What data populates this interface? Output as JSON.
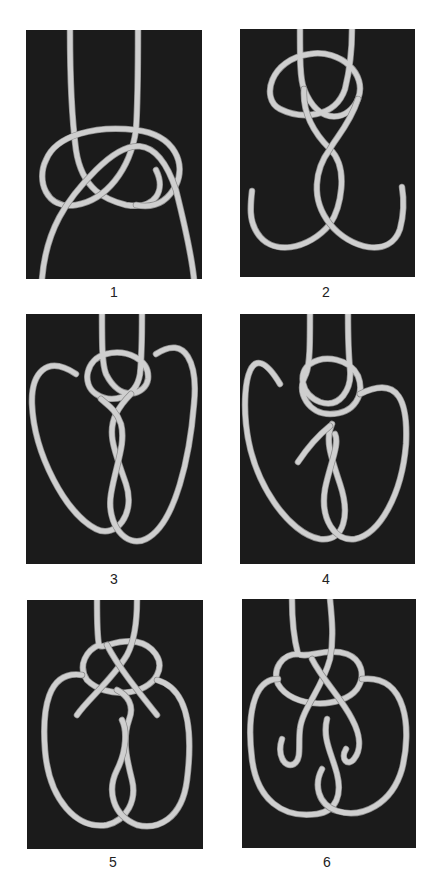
{
  "figure": {
    "panels": [
      {
        "number": "1"
      },
      {
        "number": "2"
      },
      {
        "number": "3"
      },
      {
        "number": "4"
      },
      {
        "number": "5"
      },
      {
        "number": "6"
      }
    ],
    "colors": {
      "background": "#1b1b1b",
      "rope": "#cfcfcf",
      "page": "#ffffff"
    }
  }
}
